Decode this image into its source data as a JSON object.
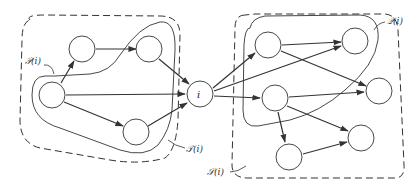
{
  "diagram": {
    "type": "directed-graph",
    "central_node_label": "i",
    "region_labels": {
      "left_solid": "𝒫(i)",
      "left_dashed": "𝒯(i)",
      "right_dashed": "𝒮(i)",
      "right_solid": "𝒬(i)"
    },
    "colors": {
      "stroke": "#333333",
      "background": "#ffffff"
    },
    "nodes": [
      {
        "id": "L1",
        "x": 52,
        "y": 95
      },
      {
        "id": "L2",
        "x": 82,
        "y": 49
      },
      {
        "id": "L3",
        "x": 149,
        "y": 49
      },
      {
        "id": "L4",
        "x": 136,
        "y": 132
      },
      {
        "id": "i",
        "x": 200,
        "y": 94
      },
      {
        "id": "R1",
        "x": 268,
        "y": 45
      },
      {
        "id": "R2",
        "x": 355,
        "y": 41
      },
      {
        "id": "R3",
        "x": 275,
        "y": 98
      },
      {
        "id": "R4",
        "x": 379,
        "y": 91
      },
      {
        "id": "R5",
        "x": 361,
        "y": 138
      },
      {
        "id": "R6",
        "x": 289,
        "y": 157
      }
    ],
    "edges": [
      [
        "L1",
        "L2"
      ],
      [
        "L2",
        "L3"
      ],
      [
        "L1",
        "i"
      ],
      [
        "L1",
        "L4"
      ],
      [
        "L3",
        "i"
      ],
      [
        "L4",
        "i"
      ],
      [
        "i",
        "R1"
      ],
      [
        "i",
        "R2"
      ],
      [
        "i",
        "R3"
      ],
      [
        "R1",
        "R2"
      ],
      [
        "R1",
        "R4"
      ],
      [
        "R3",
        "R4"
      ],
      [
        "R3",
        "R5"
      ],
      [
        "R3",
        "R6"
      ],
      [
        "R6",
        "R5"
      ]
    ]
  }
}
